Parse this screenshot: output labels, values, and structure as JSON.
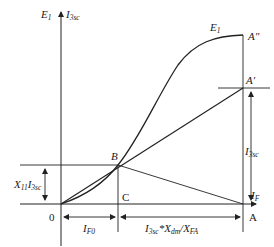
{
  "diagram": {
    "type": "phasor/characteristic diagram",
    "axes": {
      "y_label_left": "E",
      "y_label_left_sub": "1",
      "y_label_right": "I",
      "y_label_right_sub": "3sc",
      "x_label": "I",
      "x_label_sub": "F",
      "origin": "0"
    },
    "curve_label": "E",
    "curve_label_sub": "1",
    "points": {
      "A_double_prime": "A″",
      "A_prime": "A′",
      "A": "A",
      "B": "B",
      "C": "C"
    },
    "dimensions": {
      "left_height_main": "X",
      "left_height_sub1": "11",
      "left_height_main2": "I",
      "left_height_sub2": "3sc",
      "right_height_main": "I",
      "right_height_sub": "3sc",
      "bottom_left_main": "I",
      "bottom_left_sub": "F0",
      "bottom_right_part1": "I",
      "bottom_right_sub1": "3sc",
      "bottom_right_part2": "*X",
      "bottom_right_sub2": "dm",
      "bottom_right_part3": "/X",
      "bottom_right_sub3": "FA"
    },
    "colors": {
      "line": "#222222",
      "background": "#ffffff"
    }
  }
}
